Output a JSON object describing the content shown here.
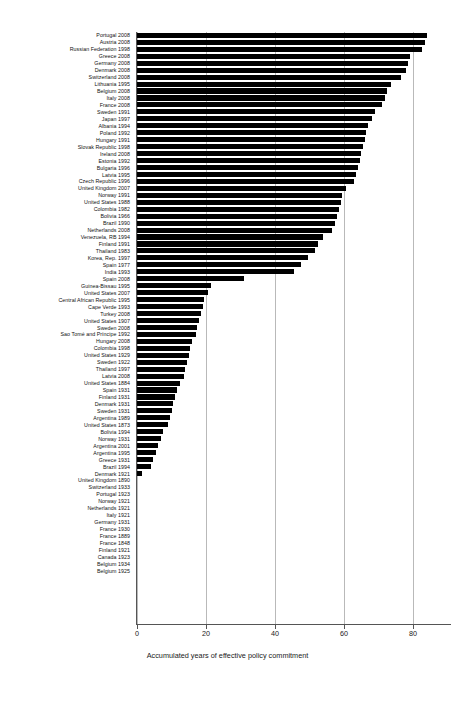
{
  "chart_data": {
    "type": "bar",
    "orientation": "horizontal",
    "title": "",
    "subtitle": "",
    "xlabel": "Accumulated years of effective policy commitment",
    "ylabel": "",
    "xlim": [
      0,
      88
    ],
    "xticks": [
      0,
      20,
      40,
      60,
      80
    ],
    "xticklabels": [
      "0",
      "20",
      "40",
      "60",
      "80"
    ],
    "grid": "vertical",
    "legend": "none",
    "bar_color": "#000000",
    "categories": [
      "Portugal 2008",
      "Austria 2008",
      "Russian Federation 1998",
      "Greece 2008",
      "Germany 2008",
      "Denmark 2008",
      "Switzerland 2008",
      "Lithuania 1995",
      "Belgium 2008",
      "Italy 2008",
      "France 2008",
      "Sweden 1991",
      "Japan 1997",
      "Albania 1994",
      "Poland 1992",
      "Hungary 1991",
      "Slovak Republic 1998",
      "Ireland 2008",
      "Estonia 1992",
      "Bulgaria 1996",
      "Latvia 1995",
      "Czech Republic 1996",
      "United Kingdom 2007",
      "Norway 1991",
      "United States 1988",
      "Colombia 1982",
      "Bolivia 1966",
      "Brazil 1990",
      "Netherlands 2008",
      "Venezuela, RB 1994",
      "Finland 1991",
      "Thailand 1983",
      "Korea, Rep. 1997",
      "Spain 1977",
      "India 1993",
      "Spain 2008",
      "Guinea-Bissau 1995",
      "United States 2007",
      "Central African Republic 1995",
      "Cape Verde 1993",
      "Turkey 2008",
      "United States 1907",
      "Sweden 2008",
      "Sao Tomé and Príncipe 1992",
      "Hungary 2008",
      "Colombia 1998",
      "United States 1929",
      "Sweden 1922",
      "Thailand 1997",
      "Latvia 2008",
      "United States 1884",
      "Spain 1931",
      "Finland 1931",
      "Denmark 1931",
      "Sweden 1931",
      "Argentina 1989",
      "United States 1873",
      "Bolivia 1994",
      "Norway 1931",
      "Argentina 2001",
      "Argentina 1995",
      "Greece 1931",
      "Brazil 1994",
      "Denmark 1921",
      "United Kingdom 1890",
      "Switzerland 1933",
      "Portugal 1923",
      "Norway 1921",
      "Netherlands 1921",
      "Italy 1921",
      "Germany 1931",
      "France 1930",
      "France 1889",
      "France 1848",
      "Finland 1921",
      "Canada 1923",
      "Belgium 1934",
      "Belgium 1925"
    ],
    "values": [
      84.0,
      83.5,
      82.5,
      79.0,
      78.5,
      78.0,
      76.5,
      73.5,
      72.5,
      72.0,
      71.0,
      69.0,
      68.0,
      67.0,
      66.5,
      66.0,
      65.5,
      65.0,
      64.5,
      64.0,
      63.5,
      63.0,
      60.5,
      59.5,
      59.0,
      58.5,
      58.0,
      57.5,
      56.5,
      54.0,
      52.5,
      51.5,
      49.5,
      47.5,
      45.5,
      31.0,
      21.5,
      20.5,
      19.5,
      19.0,
      18.5,
      18.0,
      17.5,
      17.0,
      16.0,
      15.5,
      15.0,
      14.5,
      14.0,
      13.5,
      12.5,
      11.5,
      11.0,
      10.5,
      10.0,
      9.5,
      9.0,
      7.5,
      7.0,
      6.0,
      5.5,
      4.5,
      4.0,
      1.5,
      0,
      0,
      0,
      0,
      0,
      0,
      0,
      0,
      0,
      0,
      0,
      0,
      0,
      0
    ]
  },
  "axis": {
    "x_title": "Accumulated years of effective policy commitment",
    "tick_labels": [
      "0",
      "20",
      "40",
      "60",
      "80"
    ]
  }
}
